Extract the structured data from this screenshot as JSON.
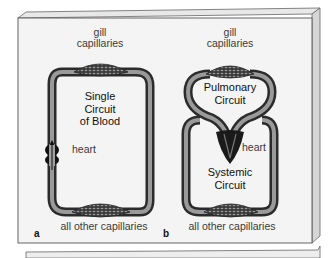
{
  "figure": {
    "panel_a": {
      "letter": "a",
      "top_label_line1": "gill",
      "top_label_line2": "capillaries",
      "title_line1": "Single",
      "title_line2": "Circuit",
      "title_line3": "of Blood",
      "heart_label": "heart",
      "bottom_label": "all other capillaries"
    },
    "panel_b": {
      "letter": "b",
      "top_label_line1": "gill",
      "top_label_line2": "capillaries",
      "upper_circuit_line1": "Pulmonary",
      "upper_circuit_line2": "Circuit",
      "heart_label": "heart",
      "lower_circuit_line1": "Systemic",
      "lower_circuit_line2": "Circuit",
      "bottom_label": "all other capillaries"
    },
    "colors": {
      "vessel_dark": "#2b2b2b",
      "vessel_mid": "#6e6e6e",
      "vessel_light": "#a9a9a9",
      "board_face": "#f4f4f4",
      "board_side": "#d6d6d6",
      "board_edge": "#555555"
    }
  }
}
